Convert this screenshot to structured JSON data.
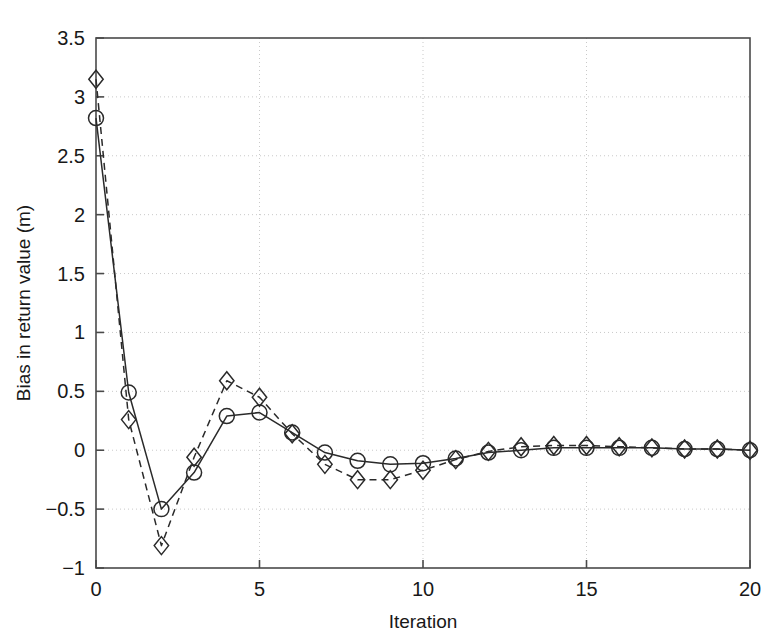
{
  "chart_data": {
    "type": "line",
    "title": "",
    "xlabel": "Iteration",
    "ylabel": "Bias in return value (m)",
    "xlim": [
      0,
      20
    ],
    "ylim": [
      -1,
      3.5
    ],
    "xticks": [
      0,
      5,
      10,
      15,
      20
    ],
    "xticklabels": [
      "0",
      "5",
      "10",
      "15",
      "20"
    ],
    "yticks": [
      -1,
      -0.5,
      0,
      0.5,
      1,
      1.5,
      2,
      2.5,
      3,
      3.5
    ],
    "yticklabels": [
      "-1",
      "-0.5",
      "0",
      "0.5",
      "1",
      "1.5",
      "2",
      "2.5",
      "3",
      "3.5"
    ],
    "grid": true,
    "legend": "none",
    "x": [
      0,
      1,
      2,
      3,
      4,
      5,
      6,
      7,
      8,
      9,
      10,
      11,
      12,
      13,
      14,
      15,
      16,
      17,
      18,
      19,
      20
    ],
    "series": [
      {
        "name": "solid-circle-series",
        "marker": "circle",
        "linestyle": "solid",
        "color": "#2a2a2a",
        "values": [
          2.82,
          0.49,
          -0.5,
          -0.19,
          0.29,
          0.32,
          0.15,
          -0.02,
          -0.09,
          -0.12,
          -0.11,
          -0.07,
          -0.02,
          0.0,
          0.02,
          0.02,
          0.02,
          0.02,
          0.01,
          0.01,
          0.0
        ]
      },
      {
        "name": "dashed-diamond-series",
        "marker": "diamond",
        "linestyle": "dashed",
        "color": "#2a2a2a",
        "values": [
          3.15,
          0.26,
          -0.81,
          -0.06,
          0.59,
          0.45,
          0.14,
          -0.12,
          -0.25,
          -0.25,
          -0.17,
          -0.08,
          -0.01,
          0.03,
          0.04,
          0.04,
          0.03,
          0.02,
          0.01,
          0.01,
          0.0
        ]
      }
    ]
  },
  "axes": {
    "xlabel": "Iteration",
    "ylabel": "Bias in return value (m)"
  }
}
